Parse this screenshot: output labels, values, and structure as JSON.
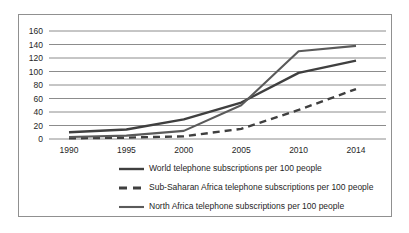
{
  "chart_data": {
    "type": "line",
    "categories": [
      "1990",
      "1995",
      "2000",
      "2005",
      "2010",
      "2014"
    ],
    "series": [
      {
        "name": "World",
        "legend_label": "World telephone subscriptions per 100 people",
        "values": [
          10,
          14,
          29,
          54,
          98,
          116
        ],
        "color": "#3f3f3f",
        "line_style": "solid",
        "line_width": 2.4
      },
      {
        "name": "Sub-Saharan Africa",
        "legend_label": "Sub-Saharan Africa telephone subscriptions per 100 people",
        "values": [
          1,
          2,
          4,
          15,
          43,
          74
        ],
        "color": "#3f3f3f",
        "line_style": "dashed",
        "line_width": 2.4
      },
      {
        "name": "North Africa",
        "legend_label": "North Africa telephone subscriptions per 100 people",
        "values": [
          3,
          5,
          12,
          50,
          130,
          138
        ],
        "color": "#5a5a5a",
        "line_style": "solid",
        "line_width": 2.1
      }
    ],
    "yticks": [
      0,
      20,
      40,
      60,
      80,
      100,
      120,
      140,
      160
    ],
    "ylim": [
      0,
      160
    ],
    "xlabel": "",
    "ylabel": "",
    "grid": "horizontal",
    "legend_position": "bottom-left",
    "gridline_color": "#8c8c8c",
    "text_color": "#262626",
    "border_color": "#909090"
  }
}
